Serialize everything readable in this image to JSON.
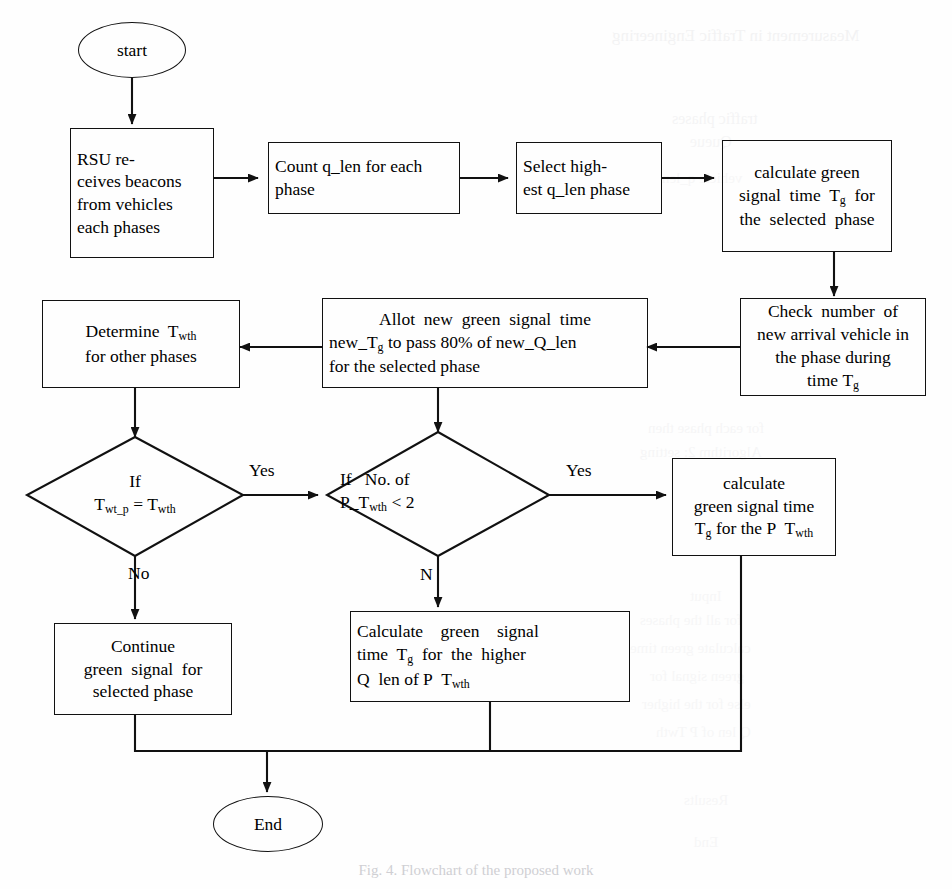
{
  "figure": {
    "type": "flowchart",
    "caption": "Fig. 4. Flowchart of the proposed work"
  },
  "nodes": {
    "start": {
      "id": "start",
      "shape": "terminator",
      "label": "start"
    },
    "rsu": {
      "id": "rsu",
      "shape": "process",
      "lines": [
        "RSU re-",
        "ceives beacons",
        "from vehicles",
        "each phases"
      ],
      "label": "RSU receives beacons from vehicles each phases"
    },
    "count": {
      "id": "count",
      "shape": "process",
      "lines": [
        "Count q_len for each",
        "phase"
      ],
      "label": "Count q_len for each phase"
    },
    "select": {
      "id": "select",
      "shape": "process",
      "lines": [
        "Select high-",
        "est q_len phase"
      ],
      "label": "Select highest q_len phase"
    },
    "calc_tg": {
      "id": "calc_tg",
      "shape": "process",
      "lines": [
        "calculate green",
        "signal time T_g for",
        "the selected phase"
      ],
      "label": "calculate green signal time Tg for the selected phase"
    },
    "check_arrival": {
      "id": "check_arrival",
      "shape": "process",
      "lines": [
        "Check number of",
        "new arrival vehicle in",
        "the phase during time T_g"
      ],
      "label": "Check number of new arrival vehicle in the phase during time Tg"
    },
    "allot": {
      "id": "allot",
      "shape": "process",
      "lines": [
        "Allot new green signal time",
        "new_T_g to pass 80% of new_Q_len",
        "for the selected phase"
      ],
      "label": "Allot new green signal time new_Tg to pass 80% of new_Q_len for the selected phase",
      "percent": "80%"
    },
    "determine": {
      "id": "determine",
      "shape": "process",
      "lines": [
        "Determine T_wth",
        "for other phases"
      ],
      "label": "Determine Twth for other phases"
    },
    "decision_twt": {
      "id": "decision_twt",
      "shape": "decision",
      "lines": [
        "If",
        "T_wt_p = T_wth"
      ],
      "label": "If Twt_p = Twth"
    },
    "decision_count": {
      "id": "decision_count",
      "shape": "decision",
      "lines": [
        "If No. of",
        "P_T_wth < 2"
      ],
      "label": "If No. of P_Twth < 2",
      "threshold": "2"
    },
    "calc_p": {
      "id": "calc_p",
      "shape": "process",
      "lines": [
        "calculate",
        "green signal time",
        "T_g for the P T_wth"
      ],
      "label": "calculate green signal time Tg for the P Twth"
    },
    "calc_higher": {
      "id": "calc_higher",
      "shape": "process",
      "lines": [
        "Calculate green signal",
        "time T_g for the higher",
        "Q len of P T_wth"
      ],
      "label": "Calculate green signal time Tg for the higher Q len of P Twth"
    },
    "continue": {
      "id": "continue",
      "shape": "process",
      "lines": [
        "Continue",
        "green signal for",
        "selected phase"
      ],
      "label": "Continue green signal for selected phase"
    },
    "end": {
      "id": "end",
      "shape": "terminator",
      "label": "End"
    }
  },
  "edge_labels": {
    "yes_left": "Yes",
    "no_left": "No",
    "yes_right": "Yes",
    "no_right": "N"
  },
  "bleed_text": [
    {
      "text": "Measurement in Traffic Engineering",
      "x": 612,
      "y": 26,
      "size": 17,
      "opacity": 0.3
    },
    {
      "text": "traffic phases",
      "x": 672,
      "y": 110,
      "size": 16,
      "opacity": 0.26
    },
    {
      "text": "Queue",
      "x": 690,
      "y": 133,
      "size": 16,
      "opacity": 0.22
    },
    {
      "text": "vehicle q_len",
      "x": 662,
      "y": 170,
      "size": 15,
      "opacity": 0.2
    },
    {
      "text": "for each phase then",
      "x": 648,
      "y": 420,
      "size": 15,
      "opacity": 0.22
    },
    {
      "text": "Algorithm 2: setting",
      "x": 640,
      "y": 444,
      "size": 15,
      "opacity": 0.22
    },
    {
      "text": "Input",
      "x": 690,
      "y": 588,
      "size": 15,
      "opacity": 0.2
    },
    {
      "text": "for all the phases",
      "x": 640,
      "y": 612,
      "size": 15,
      "opacity": 0.2
    },
    {
      "text": "calculate green time",
      "x": 630,
      "y": 640,
      "size": 15,
      "opacity": 0.2
    },
    {
      "text": "green signal for",
      "x": 650,
      "y": 668,
      "size": 15,
      "opacity": 0.2
    },
    {
      "text": "else for the higher",
      "x": 642,
      "y": 696,
      "size": 15,
      "opacity": 0.2
    },
    {
      "text": "Q len of P Twth",
      "x": 656,
      "y": 724,
      "size": 15,
      "opacity": 0.2
    },
    {
      "text": "Results",
      "x": 684,
      "y": 792,
      "size": 15,
      "opacity": 0.2
    },
    {
      "text": "End",
      "x": 694,
      "y": 834,
      "size": 15,
      "opacity": 0.2
    }
  ],
  "colors": {
    "stroke": "#111111",
    "text": "#000000",
    "background": "#ffffff",
    "bleed": "#d9d9dc"
  }
}
